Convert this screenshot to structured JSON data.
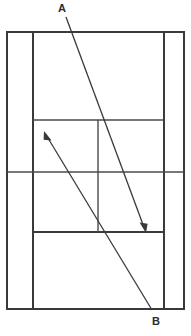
{
  "diagram": {
    "background_color": "#ffffff",
    "line_color": "#3a3a3a",
    "arrow_color": "#3a3a3a",
    "label_color": "#2b2b2b",
    "width": 191,
    "height": 336
  },
  "labels": {
    "a": "A",
    "b": "B"
  },
  "court": {
    "name": "tennis-court",
    "outer": {
      "x": 7,
      "y": 32,
      "width": 177,
      "height": 277
    },
    "lines": [
      {
        "name": "left-doubles-sideline",
        "x1": 7,
        "y1": 32,
        "x2": 7,
        "y2": 309,
        "weight": 2.0
      },
      {
        "name": "right-doubles-sideline",
        "x1": 184,
        "y1": 32,
        "x2": 184,
        "y2": 309,
        "weight": 2.0
      },
      {
        "name": "top-baseline",
        "x1": 7,
        "y1": 32,
        "x2": 184,
        "y2": 32,
        "weight": 2.0
      },
      {
        "name": "bottom-baseline",
        "x1": 7,
        "y1": 309,
        "x2": 184,
        "y2": 309,
        "weight": 2.0
      },
      {
        "name": "left-singles-sideline",
        "x1": 33,
        "y1": 32,
        "x2": 33,
        "y2": 309,
        "weight": 2.0
      },
      {
        "name": "right-singles-sideline",
        "x1": 164,
        "y1": 32,
        "x2": 164,
        "y2": 309,
        "weight": 2.0
      },
      {
        "name": "net-line",
        "x1": 7,
        "y1": 172,
        "x2": 184,
        "y2": 172,
        "weight": 1.4
      },
      {
        "name": "far-service-line",
        "x1": 33,
        "y1": 120,
        "x2": 164,
        "y2": 120,
        "weight": 1.4
      },
      {
        "name": "near-service-line",
        "x1": 33,
        "y1": 232,
        "x2": 164,
        "y2": 232,
        "weight": 2.0
      },
      {
        "name": "center-service-line",
        "x1": 98,
        "y1": 120,
        "x2": 98,
        "y2": 232,
        "weight": 1.4
      }
    ]
  },
  "arrows": [
    {
      "name": "arrow-a",
      "label": "A",
      "from": {
        "x": 66,
        "y": 17
      },
      "to": {
        "x": 146,
        "y": 232
      },
      "direction": "down-right",
      "head_at": "to"
    },
    {
      "name": "arrow-b",
      "label": "B",
      "from": {
        "x": 152,
        "y": 310
      },
      "to": {
        "x": 44,
        "y": 132
      },
      "direction": "up-left",
      "head_at": "to"
    }
  ]
}
